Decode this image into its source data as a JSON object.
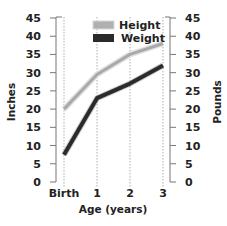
{
  "chart_data": {
    "type": "line",
    "title": "",
    "x": [
      "Birth",
      "1",
      "2",
      "3"
    ],
    "xlabel": "Age (years)",
    "ylabel": "Inches",
    "ylabel_right": "Pounds",
    "ylim": [
      0,
      45
    ],
    "yticks": [
      0,
      5,
      10,
      15,
      20,
      25,
      30,
      35,
      40,
      45
    ],
    "grid": "vertical dotted lines at each age",
    "legend_position": "upper center",
    "series": [
      {
        "name": "Height",
        "axis": "left",
        "color": "#a9a9a9",
        "values": [
          20,
          29.5,
          35,
          38
        ]
      },
      {
        "name": "Weight",
        "axis": "right",
        "color": "#2b2b2b",
        "values": [
          7.5,
          23,
          27,
          32
        ]
      }
    ]
  },
  "legend": {
    "height_label": "Height",
    "weight_label": "Weight"
  },
  "axes": {
    "x_title": "Age (years)",
    "left_title": "Inches",
    "right_title": "Pounds"
  }
}
